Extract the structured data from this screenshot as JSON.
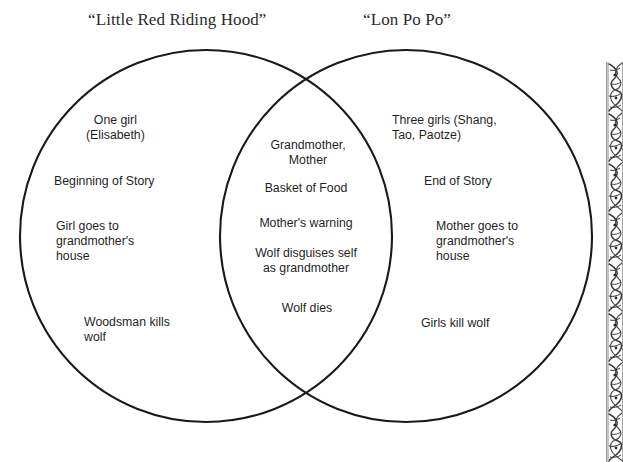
{
  "document": {
    "type": "venn-diagram",
    "topic": "Story comparison Venn diagram"
  },
  "titles": {
    "left": "“Little Red Riding Hood”",
    "right": "“Lon Po Po”"
  },
  "venn": {
    "left_circle": {
      "label": "“Little Red Riding Hood”",
      "cx": 206,
      "cy": 236,
      "r": 186,
      "stroke": "#1a1a1a"
    },
    "right_circle": {
      "label": "“Lon Po Po”",
      "cx": 406,
      "cy": 236,
      "r": 186,
      "stroke": "#1a1a1a"
    },
    "left_only": [
      "One girl\n(Elisabeth)",
      "Beginning of Story",
      "Girl goes to\ngrandmother's\nhouse",
      "Woodsman kills\nwolf"
    ],
    "intersection": [
      "Grandmother,\nMother",
      "Basket of Food",
      "Mother's warning",
      "Wolf disguises self\nas grandmother",
      "Wolf dies"
    ],
    "right_only": [
      "Three girls (Shang,\nTao, Paotze)",
      "End of Story",
      "Mother goes to\ngrandmother's\nhouse",
      "Girls kill wolf"
    ]
  },
  "ornament": {
    "name": "decorative-border-strip",
    "description": "vertical engraved floral ornament band along the right page edge",
    "ink": "#3a3a3a"
  },
  "colors": {
    "background": "#ffffff",
    "ink": "#1a1a1a",
    "title_ink": "#2b2b2b"
  }
}
